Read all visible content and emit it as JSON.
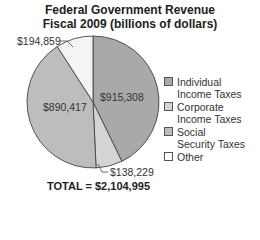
{
  "chart_data": {
    "type": "pie",
    "title": "Federal Government Revenue",
    "subtitle": "Fiscal 2009 (billions of dollars)",
    "categories": [
      "Individual Income Taxes",
      "Corporate Income Taxes",
      "Social Security Taxes",
      "Other"
    ],
    "values": [
      915308,
      138229,
      890417,
      194859
    ],
    "labels": [
      "$915,308",
      "$138,229",
      "$890,417",
      "$194,859"
    ],
    "colors": [
      "#a9a9a9",
      "#d4d4d4",
      "#bdbdbd",
      "#f4f4f4"
    ],
    "total_label": "TOTAL = $2,104,995",
    "legend_position": "right"
  },
  "title": {
    "line1": "Federal Government Revenue",
    "line2": "Fiscal 2009 (billions of dollars)"
  },
  "legend": {
    "items": [
      {
        "line1": "Individual",
        "line2": "Income Taxes"
      },
      {
        "line1": "Corporate",
        "line2": "Income Taxes"
      },
      {
        "line1": "Social",
        "line2": "Security Taxes"
      },
      {
        "line1": "Other",
        "line2": ""
      }
    ]
  },
  "slice_labels": {
    "individual": "$915,308",
    "corporate": "$138,229",
    "social": "$890,417",
    "other": "$194,859"
  },
  "total": "TOTAL = $2,104,995"
}
